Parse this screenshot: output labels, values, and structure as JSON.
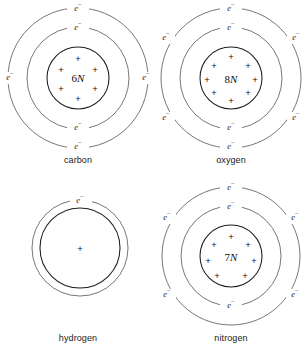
{
  "figure": {
    "background": "#ffffff",
    "line_color": "#4a4a4a",
    "nucleus_color": "#1d1d1d",
    "text_color": "#1a1a1a",
    "electron_symbol": "e",
    "electron_superscript": "−",
    "proton_symbol": "+"
  },
  "atoms": [
    {
      "id": "carbon",
      "label": "carbon",
      "nucleus_label": "6N",
      "nucleus_number": "6",
      "nucleus_letter": "N",
      "proton_count": 6,
      "shells": [
        {
          "index": 1,
          "electron_count": 2
        },
        {
          "index": 2,
          "electron_count": 4
        }
      ],
      "total_electrons": 6
    },
    {
      "id": "oxygen",
      "label": "oxygen",
      "nucleus_label": "8N",
      "nucleus_number": "8",
      "nucleus_letter": "N",
      "proton_count": 8,
      "shells": [
        {
          "index": 1,
          "electron_count": 2
        },
        {
          "index": 2,
          "electron_count": 6
        }
      ],
      "total_electrons": 8
    },
    {
      "id": "hydrogen",
      "label": "hydrogen",
      "nucleus_label": "",
      "nucleus_number": "",
      "nucleus_letter": "",
      "proton_count": 1,
      "shells": [
        {
          "index": 1,
          "electron_count": 1
        }
      ],
      "total_electrons": 1
    },
    {
      "id": "nitrogen",
      "label": "nitrogen",
      "nucleus_label": "7N",
      "nucleus_number": "7",
      "nucleus_letter": "N",
      "proton_count": 7,
      "shells": [
        {
          "index": 1,
          "electron_count": 2
        },
        {
          "index": 2,
          "electron_count": 5
        }
      ],
      "total_electrons": 7
    }
  ]
}
